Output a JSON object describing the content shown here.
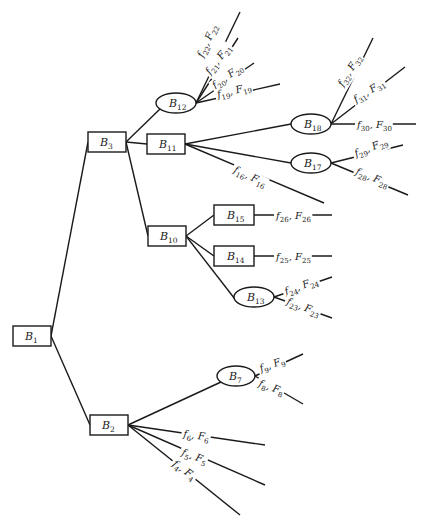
{
  "diagram": {
    "type": "tree",
    "nodes": [
      {
        "id": "B1",
        "base": "B",
        "sub": "1",
        "shape": "rect",
        "cx": 32,
        "cy": 336,
        "w": 38,
        "h": 20
      },
      {
        "id": "B2",
        "base": "B",
        "sub": "2",
        "shape": "rect",
        "cx": 109,
        "cy": 425,
        "w": 38,
        "h": 20
      },
      {
        "id": "B3",
        "base": "B",
        "sub": "3",
        "shape": "rect",
        "cx": 107,
        "cy": 142,
        "w": 38,
        "h": 20
      },
      {
        "id": "B7",
        "base": "B",
        "sub": "7",
        "shape": "ellipse",
        "cx": 236,
        "cy": 376,
        "w": 38,
        "h": 20
      },
      {
        "id": "B10",
        "base": "B",
        "sub": "10",
        "shape": "rect",
        "cx": 167,
        "cy": 236,
        "w": 38,
        "h": 20
      },
      {
        "id": "B11",
        "base": "B",
        "sub": "11",
        "shape": "rect",
        "cx": 166,
        "cy": 144,
        "w": 38,
        "h": 20
      },
      {
        "id": "B12",
        "base": "B",
        "sub": "12",
        "shape": "ellipse",
        "cx": 176,
        "cy": 103,
        "w": 40,
        "h": 20
      },
      {
        "id": "B13",
        "base": "B",
        "sub": "13",
        "shape": "ellipse",
        "cx": 254,
        "cy": 297,
        "w": 40,
        "h": 20
      },
      {
        "id": "B14",
        "base": "B",
        "sub": "14",
        "shape": "rect",
        "cx": 234,
        "cy": 256,
        "w": 40,
        "h": 20
      },
      {
        "id": "B15",
        "base": "B",
        "sub": "15",
        "shape": "rect",
        "cx": 234,
        "cy": 215,
        "w": 40,
        "h": 20
      },
      {
        "id": "B17",
        "base": "B",
        "sub": "17",
        "shape": "ellipse",
        "cx": 311,
        "cy": 163,
        "w": 40,
        "h": 20
      },
      {
        "id": "B18",
        "base": "B",
        "sub": "18",
        "shape": "ellipse",
        "cx": 311,
        "cy": 124,
        "w": 40,
        "h": 20
      }
    ],
    "edges": [
      [
        "B1",
        "B3"
      ],
      [
        "B1",
        "B2"
      ],
      [
        "B3",
        "B12"
      ],
      [
        "B3",
        "B11"
      ],
      [
        "B3",
        "B10"
      ],
      [
        "B11",
        "B18"
      ],
      [
        "B11",
        "B17"
      ],
      [
        "B10",
        "B15"
      ],
      [
        "B10",
        "B14"
      ],
      [
        "B10",
        "B13"
      ],
      [
        "B2",
        "B7"
      ]
    ],
    "leaves": [
      {
        "from": "B12",
        "f": "22",
        "F": "22",
        "end": [
          240,
          12
        ],
        "lx": 203,
        "ly": 58,
        "rot": -66
      },
      {
        "from": "B12",
        "f": "21",
        "F": "21",
        "end": [
          238,
          38
        ],
        "lx": 210,
        "ly": 75,
        "rot": -52
      },
      {
        "from": "B12",
        "f": "20",
        "F": "20",
        "end": [
          254,
          63
        ],
        "lx": 215,
        "ly": 89,
        "rot": -35
      },
      {
        "from": "B12",
        "f": "19",
        "F": "19",
        "end": [
          280,
          84
        ],
        "lx": 218,
        "ly": 98,
        "rot": -14
      },
      {
        "from": "B18",
        "f": "32",
        "F": "32",
        "end": [
          373,
          38
        ],
        "lx": 343,
        "ly": 87,
        "rot": -58
      },
      {
        "from": "B18",
        "f": "31",
        "F": "31",
        "end": [
          405,
          67
        ],
        "lx": 356,
        "ly": 103,
        "rot": -32
      },
      {
        "from": "B18",
        "f": "30",
        "F": "30",
        "end": [
          416,
          124
        ],
        "lx": 357,
        "ly": 128,
        "rot": 0
      },
      {
        "from": "B11",
        "f": "16",
        "F": "16",
        "end": [
          324,
          203
        ],
        "lx": 233,
        "ly": 172,
        "rot": 25
      },
      {
        "from": "B17",
        "f": "29",
        "F": "29",
        "end": [
          403,
          145
        ],
        "lx": 356,
        "ly": 157,
        "rot": -22
      },
      {
        "from": "B17",
        "f": "28",
        "F": "28",
        "end": [
          408,
          195
        ],
        "lx": 355,
        "ly": 174,
        "rot": 22
      },
      {
        "from": "B15",
        "f": "26",
        "F": "26",
        "end": [
          332,
          215
        ],
        "lx": 276,
        "ly": 219,
        "rot": 0
      },
      {
        "from": "B14",
        "f": "25",
        "F": "25",
        "end": [
          332,
          256
        ],
        "lx": 276,
        "ly": 260,
        "rot": 0
      },
      {
        "from": "B13",
        "f": "24",
        "F": "24",
        "end": [
          332,
          277
        ],
        "lx": 286,
        "ly": 295,
        "rot": -20
      },
      {
        "from": "B13",
        "f": "23",
        "F": "23",
        "end": [
          332,
          318
        ],
        "lx": 286,
        "ly": 304,
        "rot": 20
      },
      {
        "from": "B7",
        "f": "9",
        "F": "9",
        "end": [
          303,
          354
        ],
        "lx": 261,
        "ly": 372,
        "rot": -20
      },
      {
        "from": "B7",
        "f": "8",
        "F": "8",
        "end": [
          303,
          404
        ],
        "lx": 258,
        "ly": 386,
        "rot": 20
      },
      {
        "from": "B2",
        "f": "6",
        "F": "6",
        "end": [
          265,
          445
        ],
        "lx": 183,
        "ly": 437,
        "rot": 8
      },
      {
        "from": "B2",
        "f": "5",
        "F": "5",
        "end": [
          265,
          485
        ],
        "lx": 181,
        "ly": 455,
        "rot": 20
      },
      {
        "from": "B2",
        "f": "4",
        "F": "4",
        "end": [
          240,
          515
        ],
        "lx": 172,
        "ly": 465,
        "rot": 36
      }
    ]
  }
}
